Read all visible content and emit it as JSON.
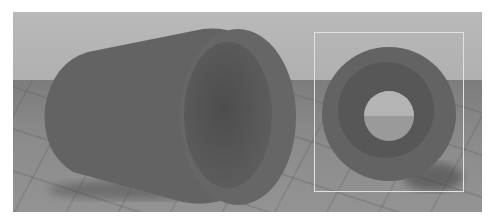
{
  "image": {
    "description": "3D render of a gray hollow tube (cylinder with bore) on a tiled floor; left: perspective view, right: front view inside highlighted frame",
    "colors": {
      "sky": "#b5b5b5",
      "floor": "#858585",
      "tube_outer": "#636363",
      "tube_inner": "#555555",
      "frame": "#e2e2e2",
      "background": "#ffffff"
    }
  }
}
